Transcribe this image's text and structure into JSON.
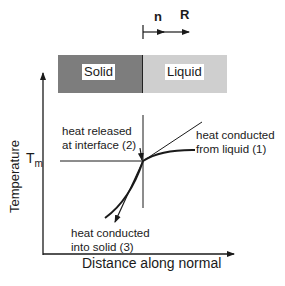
{
  "direction_labels": {
    "normal": "n",
    "velocity": "R"
  },
  "phases": {
    "solid": "Solid",
    "liquid": "Liquid"
  },
  "axes": {
    "y_label": "Temperature",
    "x_label": "Distance along normal",
    "melting_temp_label": "T",
    "melting_temp_subscript": "m"
  },
  "annotations": {
    "released_line1": "heat released",
    "released_line2": "at interface (2)",
    "liquid_line1": "heat conducted",
    "liquid_line2": "from liquid (1)",
    "solid_line1": "heat conducted",
    "solid_line2": "into solid (3)"
  },
  "colors": {
    "solid": "#7d7d7d",
    "liquid": "#cfcfcf",
    "ink": "#1a1a1a"
  }
}
